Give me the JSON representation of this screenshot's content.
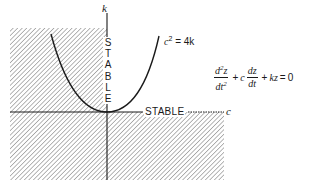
{
  "diagram": {
    "axes": {
      "vertical_label": "k",
      "horizontal_label": "c"
    },
    "labels": {
      "stable_vertical_letters": [
        "S",
        "T",
        "A",
        "B",
        "L",
        "E"
      ],
      "stable_horizontal": "STABLE",
      "curve": {
        "lhs": "c",
        "exponent": "2",
        "rhs": " = 4k"
      }
    },
    "equation": {
      "term1_num": "d",
      "term1_num_exp": "2",
      "term1_num_var": "z",
      "term1_den": "dt",
      "term1_den_exp": "2",
      "plus1": "+",
      "coef": "c",
      "term2_num": "dz",
      "term2_den": "dt",
      "plus2": "+",
      "term3": "kz",
      "equals": "=",
      "rhs": "0"
    },
    "regions": {
      "hatched": [
        "c < 0 (left half-plane)",
        "k < 0 (lower half-plane)"
      ],
      "stable": "c > 0, k > 0"
    },
    "colors": {
      "ink": "#1a1a1a",
      "hatch": "#8a8a8a",
      "background": "#ffffff"
    }
  }
}
